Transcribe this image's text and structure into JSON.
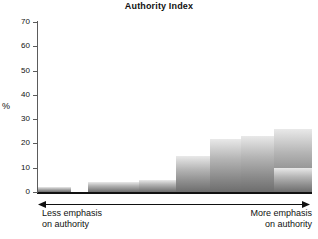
{
  "chart_data": {
    "type": "bar",
    "title": "Authority Index",
    "xlabel": "",
    "ylabel": "%",
    "ylim": [
      0,
      70
    ],
    "yticks": [
      0,
      10,
      20,
      30,
      40,
      50,
      60,
      70
    ],
    "grid": false,
    "legend": null,
    "categories": [
      "1",
      "2",
      "3",
      "4",
      "5",
      "6",
      "7",
      "8",
      "9"
    ],
    "values": [
      2,
      0,
      4,
      5,
      15,
      22,
      23,
      26,
      10
    ],
    "annotations": {
      "axis_arrow_left": "Less emphasis\non authority",
      "axis_arrow_right": "More emphasis\non authority"
    }
  },
  "chart": {
    "title": "Authority Index",
    "y_axis_title": "%",
    "y_tick_labels": [
      "70",
      "60",
      "50",
      "40",
      "30",
      "20",
      "10",
      "0"
    ],
    "caption_left_line1": "Less emphasis",
    "caption_left_line2": "on authority",
    "caption_right_line1": "More emphasis",
    "caption_right_line2": "on authority"
  },
  "colors": {
    "bar_top": "#e9e9e9",
    "bar_bottom": "#6d6d6d",
    "axis": "#111111",
    "background": "#ffffff"
  }
}
